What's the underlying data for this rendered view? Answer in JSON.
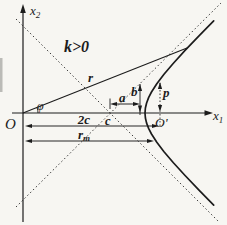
{
  "figure": {
    "colors": {
      "background": "#f7f6f2",
      "ink": "#1c1c1c"
    },
    "annotation_k": "k>0",
    "axis_vertical": {
      "base": "x",
      "sub": "2"
    },
    "axis_horizontal": {
      "base": "x",
      "sub": "1"
    },
    "origin_label": "O",
    "second_focus_label": "O'",
    "center_label": "c",
    "radius_label": "r",
    "angle_label": "φ",
    "a_label": "a",
    "b_label": "b",
    "p_label": "p",
    "focal_label": "2c",
    "rmin_label": {
      "base": "r",
      "sub": "m"
    }
  }
}
